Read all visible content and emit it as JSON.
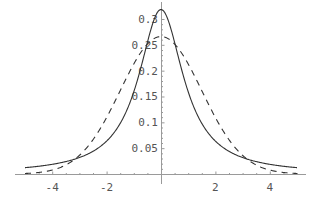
{
  "chart_data": {
    "type": "line",
    "title": "",
    "xlabel": "",
    "ylabel": "",
    "xlim": [
      -5,
      5
    ],
    "ylim": [
      0,
      0.32
    ],
    "grid": false,
    "legend": null,
    "x_ticks": [
      {
        "value": -4,
        "label": "-4"
      },
      {
        "value": -2,
        "label": "-2"
      },
      {
        "value": 2,
        "label": "2"
      },
      {
        "value": 4,
        "label": "4"
      }
    ],
    "y_ticks": [
      {
        "value": 0.05,
        "label": "0.05"
      },
      {
        "value": 0.1,
        "label": "0.1"
      },
      {
        "value": 0.15,
        "label": "0.15"
      },
      {
        "value": 0.2,
        "label": "0.2"
      },
      {
        "value": 0.25,
        "label": "0.25"
      },
      {
        "value": 0.3,
        "label": "0.3"
      }
    ],
    "series": [
      {
        "name": "solid curve (Cauchy-like density)",
        "style": "solid",
        "color": "#333333",
        "x": [
          -5,
          -4,
          -3,
          -2,
          -1.5,
          -1,
          -0.5,
          0,
          0.5,
          1,
          1.5,
          2,
          3,
          4,
          5
        ],
        "y": [
          0.012,
          0.019,
          0.032,
          0.064,
          0.098,
          0.159,
          0.255,
          0.318,
          0.255,
          0.159,
          0.098,
          0.064,
          0.032,
          0.019,
          0.012
        ]
      },
      {
        "name": "dashed curve (normal-like density)",
        "style": "dashed",
        "color": "#333333",
        "x": [
          -5,
          -4,
          -3,
          -2,
          -1.5,
          -1,
          -0.5,
          0,
          0.5,
          1,
          1.5,
          2,
          3,
          4,
          5
        ],
        "y": [
          0.001,
          0.009,
          0.036,
          0.109,
          0.161,
          0.213,
          0.252,
          0.266,
          0.252,
          0.213,
          0.161,
          0.109,
          0.036,
          0.009,
          0.001
        ]
      }
    ]
  },
  "layout": {
    "origin_px": [
      161,
      174
    ],
    "px_per_x": 27.2,
    "px_per_y": 516.7,
    "x_axis_px": [
      15,
      306
    ],
    "y_axis_px": [
      2,
      174
    ]
  }
}
